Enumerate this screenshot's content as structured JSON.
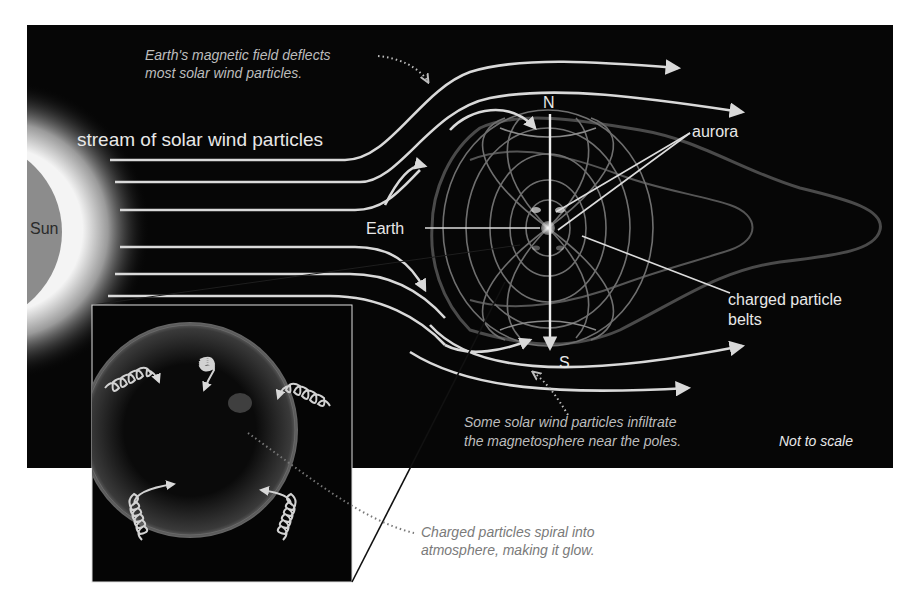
{
  "diagram": {
    "kind": "Earth magnetosphere and solar wind",
    "colors": {
      "background": "#ffffff",
      "panel": "#060606",
      "sun_fill": "#8c8c8c",
      "sun_glow": "#f2f2f2",
      "stream_lines": "#d9d9d9",
      "field_lines": "#6f6f6f",
      "caption_on_dark": "#bdbdbd",
      "caption_on_light": "#7a7a7a",
      "leader_line": "#111111"
    },
    "labels": {
      "sun": "Sun",
      "stream": "stream of solar wind particles",
      "earth": "Earth",
      "north": "N",
      "south": "S",
      "aurora": "aurora",
      "belts_line1": "charged particle",
      "belts_line2": "belts",
      "scale_note": "Not to scale"
    },
    "captions": {
      "deflect_line1": "Earth's magnetic field deflects",
      "deflect_line2": "most solar wind particles.",
      "infiltrate_line1": "Some solar wind particles infiltrate",
      "infiltrate_line2": "the magnetosphere near the poles.",
      "spiral_line1": "Charged particles spiral into",
      "spiral_line2": "atmosphere, making it glow."
    },
    "inset": {
      "description": "close-up of charged particles spiraling along field lines into the polar atmosphere"
    }
  }
}
